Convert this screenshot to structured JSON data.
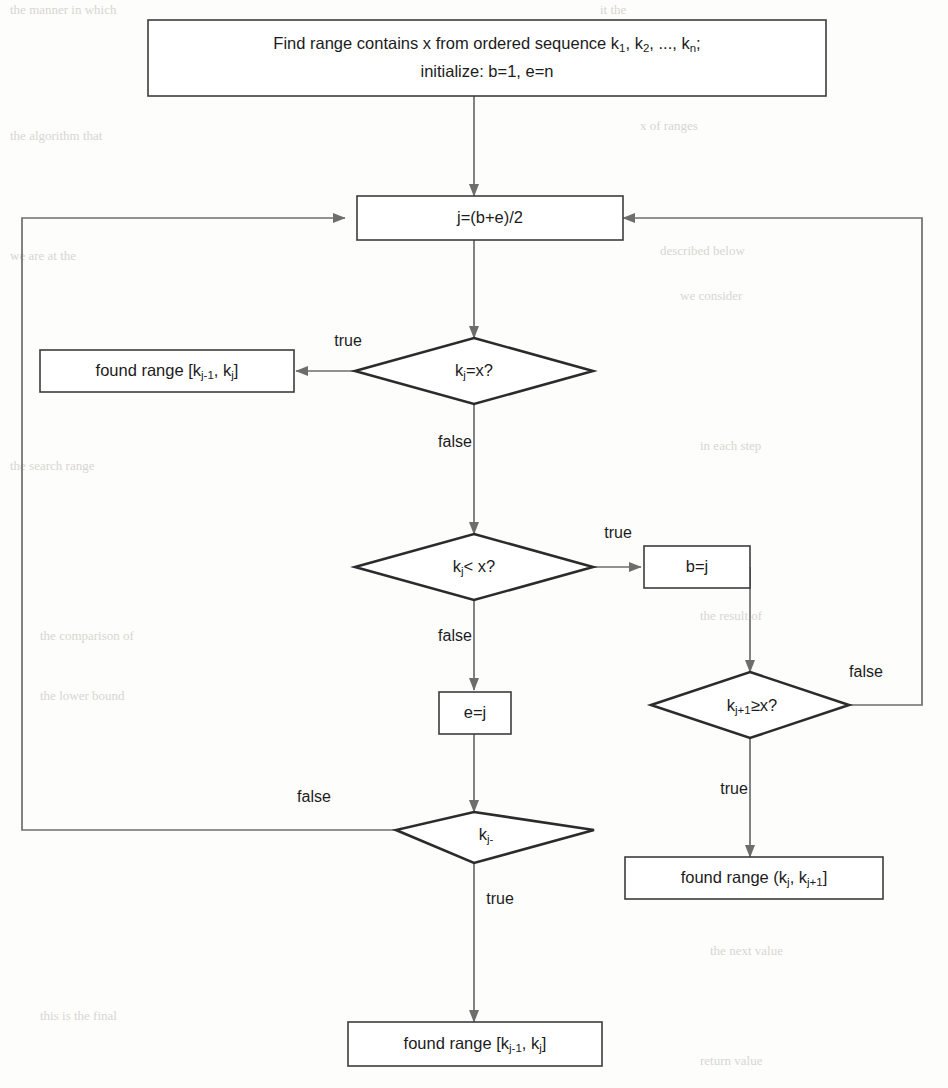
{
  "diagram": {
    "type": "flowchart",
    "colors": {
      "background": "#fdfdfc",
      "box_stroke": "#3c3c3c",
      "diamond_stroke": "#2b2b2b",
      "connector": "#6d6d6d",
      "text": "#1c1c1c"
    },
    "nodes": [
      {
        "id": "start",
        "shape": "process",
        "lines": [
          "Find range contains x from ordered sequence k1, k2, ..., kn;",
          "initialize: b=1, e=n"
        ]
      },
      {
        "id": "compute-j",
        "shape": "process",
        "label": "j=(b+e)/2"
      },
      {
        "id": "test-equal",
        "shape": "decision",
        "label": "kj=x?"
      },
      {
        "id": "found-left-upper",
        "shape": "process",
        "label": "found range [kj-1, kj]"
      },
      {
        "id": "test-less",
        "shape": "decision",
        "label": "kj< x?"
      },
      {
        "id": "set-b",
        "shape": "process",
        "label": "b=j"
      },
      {
        "id": "test-next-ge",
        "shape": "decision",
        "label": "kj+1≥x?"
      },
      {
        "id": "found-right",
        "shape": "process",
        "label": "found range (kj, kj+1]"
      },
      {
        "id": "set-e",
        "shape": "process",
        "label": "e=j"
      },
      {
        "id": "test-prev",
        "shape": "decision",
        "label": "kj-"
      },
      {
        "id": "found-bottom",
        "shape": "process",
        "label": "found range [kj-1, kj]"
      }
    ],
    "edge_labels": {
      "equal_true": "true",
      "equal_false": "false",
      "less_true": "true",
      "less_false": "false",
      "next_ge_true": "true",
      "next_ge_false": "false",
      "prev_true": "true",
      "prev_false": "false"
    }
  }
}
